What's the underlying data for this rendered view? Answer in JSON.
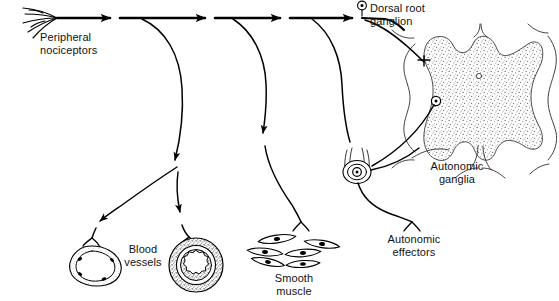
{
  "figure": {
    "background_color": "#ffffff",
    "line_color": "#000000",
    "stipple_color": "#6b6b6b"
  },
  "labels": {
    "peripheral_nociceptors": "Peripheral\nnociceptors",
    "dorsal_root_ganglion": "Dorsal root\nganglion",
    "blood_vessels": "Blood\nvessels",
    "smooth_muscle": "Smooth\nmuscle",
    "autonomic_ganglia": "Autonomic\nganglia",
    "autonomic_effectors": "Autonomic\neffectors"
  },
  "structures": [
    {
      "name": "peripheral-nociceptor-free-nerve-endings",
      "branch_count": 5
    },
    {
      "name": "main-afferent-axon",
      "arrowhead_count": 3
    },
    {
      "name": "dorsal-root-ganglion-cell-body",
      "symbol": "circle-with-dot"
    },
    {
      "name": "spinal-cord-gray-matter",
      "shape": "butterfly",
      "texture": "stippled"
    },
    {
      "name": "spinal-cord-white-matter-outline",
      "shape": "cord-outline"
    },
    {
      "name": "central-canal",
      "symbol": "small-open-circle"
    },
    {
      "name": "ventral-horn-motor-neuron",
      "symbol": "circle-with-dot"
    },
    {
      "name": "vein",
      "wall": "thin",
      "nuclei": 4
    },
    {
      "name": "artery",
      "wall": "thick-stippled-tunica-media",
      "lumen": "scalloped"
    },
    {
      "name": "smooth-muscle-cells",
      "count": 6,
      "shape": "spindle-with-nucleus"
    },
    {
      "name": "sympathetic-chain-ganglion",
      "symbol": "circle-with-dot"
    }
  ]
}
